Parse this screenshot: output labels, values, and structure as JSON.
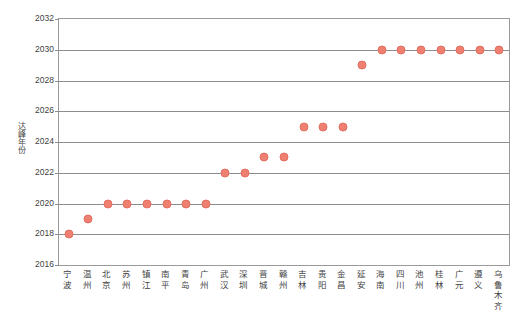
{
  "chart_data": {
    "type": "scatter",
    "title": "",
    "xlabel": "",
    "ylabel": "达峰年份",
    "ylim": [
      2016,
      2032
    ],
    "ytick_step": 2,
    "yticks": [
      2016,
      2018,
      2020,
      2022,
      2024,
      2026,
      2028,
      2030,
      2032
    ],
    "grid": true,
    "legend": "none",
    "marker_color": "#ef8071",
    "marker_edge_color": "#e2705f",
    "axis_color": "#8c8c8c",
    "categories": [
      "宁波",
      "温州",
      "北京",
      "苏州",
      "镇江",
      "南平",
      "青岛",
      "广州",
      "武汉",
      "深圳",
      "晋城",
      "赣州",
      "吉林",
      "贵阳",
      "金昌",
      "延安",
      "海南",
      "四川",
      "池州",
      "桂林",
      "广元",
      "遵义",
      "乌鲁木齐"
    ],
    "values": [
      2018,
      2019,
      2020,
      2020,
      2020,
      2020,
      2020,
      2020,
      2022,
      2022,
      2023,
      2023,
      2025,
      2025,
      2025,
      2029,
      2030,
      2030,
      2030,
      2030,
      2030,
      2030,
      2030
    ]
  }
}
